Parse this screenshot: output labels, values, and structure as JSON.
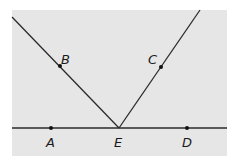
{
  "diagram": {
    "background": "#e6e6e6",
    "line_color": "#2a2a2a",
    "frame": {
      "x": 12,
      "y": 10,
      "width": 215,
      "height": 146
    },
    "baseline": {
      "x1": 12,
      "y1": 128,
      "x2": 227,
      "y2": 128
    },
    "rays": [
      {
        "name": "EB",
        "x1": 119,
        "y1": 128,
        "x2": 12,
        "y2": 17
      },
      {
        "name": "EC",
        "x1": 119,
        "y1": 128,
        "x2": 200,
        "y2": 10
      }
    ],
    "points": [
      {
        "label": "A",
        "x": 51,
        "y": 128,
        "lx": 46,
        "ly": 147
      },
      {
        "label": "B",
        "x": 60,
        "y": 66,
        "lx": 61,
        "ly": 64
      },
      {
        "label": "C",
        "x": 161,
        "y": 67,
        "lx": 148,
        "ly": 64
      },
      {
        "label": "D",
        "x": 187,
        "y": 128,
        "lx": 182,
        "ly": 147
      },
      {
        "label": "E",
        "x": 119,
        "y": 128,
        "lx": 114,
        "ly": 147
      }
    ]
  }
}
